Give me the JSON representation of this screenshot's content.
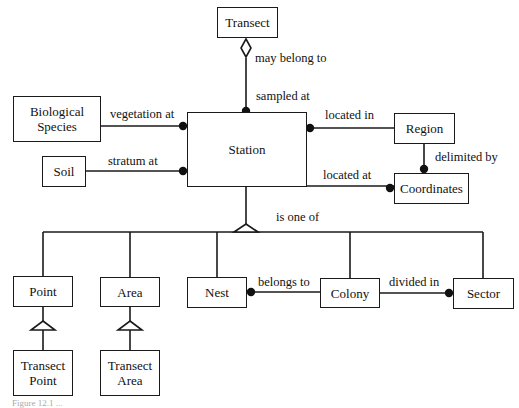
{
  "diagram": {
    "type": "entity-relationship",
    "entities": {
      "transect": "Transect",
      "biological_species": "Biological Species",
      "soil": "Soil",
      "station": "Station",
      "region": "Region",
      "coordinates": "Coordinates",
      "point": "Point",
      "area": "Area",
      "nest": "Nest",
      "colony": "Colony",
      "sector": "Sector",
      "transect_point": "Transect Point",
      "transect_area": "Transect Area"
    },
    "relationships": {
      "may_belong_to": "may belong to",
      "sampled_at": "sampled at",
      "vegetation_at": "vegetation at",
      "stratum_at": "stratum at",
      "located_in": "located in",
      "located_at": "located at",
      "delimited_by": "delimited by",
      "is_one_of": "is one of",
      "belongs_to": "belongs to",
      "divided_in": "divided in"
    },
    "edges": [
      {
        "from": "Transect",
        "to": "Station",
        "labels": [
          "may belong to",
          "sampled at"
        ],
        "from_end": "hollow-diamond",
        "to_end": "dot"
      },
      {
        "from": "Biological Species",
        "to": "Station",
        "label": "vegetation at",
        "to_end": "dot"
      },
      {
        "from": "Soil",
        "to": "Station",
        "label": "stratum at",
        "to_end": "dot"
      },
      {
        "from": "Station",
        "to": "Region",
        "label": "located in",
        "from_end": "dot"
      },
      {
        "from": "Station",
        "to": "Coordinates",
        "label": "located at",
        "to_end": "dot"
      },
      {
        "from": "Region",
        "to": "Coordinates",
        "label": "delimited by",
        "to_end": "dot"
      },
      {
        "from": "Station",
        "to": [
          "Point",
          "Area",
          "Nest",
          "Colony",
          "Sector"
        ],
        "label": "is one of",
        "type": "generalization"
      },
      {
        "from": "Nest",
        "to": "Colony",
        "label": "belongs to",
        "from_end": "dot"
      },
      {
        "from": "Colony",
        "to": "Sector",
        "label": "divided in",
        "to_end": "dot"
      },
      {
        "from": "Transect Point",
        "to": "Point",
        "type": "generalization"
      },
      {
        "from": "Transect Area",
        "to": "Area",
        "type": "generalization"
      }
    ],
    "caption": "Figure 12.1 ..."
  },
  "colors": {
    "line": "#1a1a1a",
    "background": "#ffffff"
  }
}
